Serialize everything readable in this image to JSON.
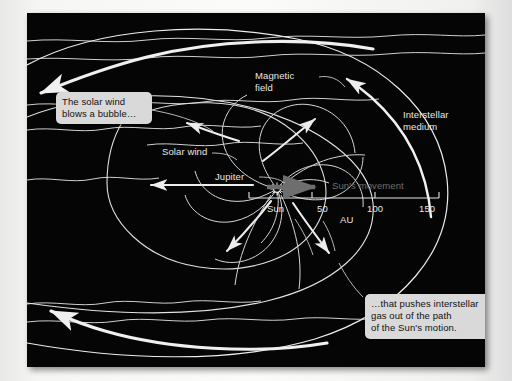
{
  "figure": {
    "domain": "diagram",
    "background_color": "#050505",
    "margin_color": "#f4f4f2",
    "line_color": "#e8e8e8",
    "canvas": {
      "x": 27,
      "y": 13,
      "width": 458,
      "height": 354
    }
  },
  "callouts": [
    {
      "id": "solar-wind-bubble",
      "text": "The solar wind\nblows a bubble…",
      "background": "#d9d9d9",
      "text_color": "#111111"
    },
    {
      "id": "interstellar-gas-push",
      "text": "…that pushes interstellar\ngas out of the path\nof the Sun's motion.",
      "background": "#d9d9d9",
      "text_color": "#111111"
    }
  ],
  "labels": {
    "magnetic_field": "Magnetic\nfield",
    "interstellar_medium": "Interstellar\nmedium",
    "solar_wind": "Solar wind",
    "jupiter": "Jupiter",
    "suns_movement": "Sun's movement"
  },
  "scale": {
    "unit": "AU",
    "origin_label": "Sun",
    "ticks": [
      "50",
      "100",
      "150"
    ],
    "tick_values": [
      0,
      50,
      100,
      150
    ],
    "axis_color": "#e8e8e8",
    "movement_arrow_color": "#6e6e6e"
  }
}
